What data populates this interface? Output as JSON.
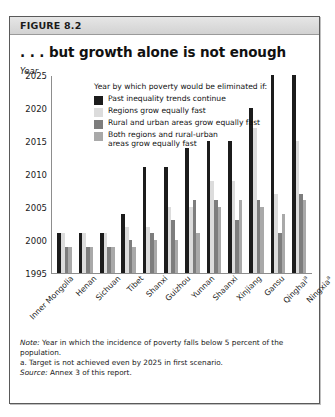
{
  "figure": {
    "number": "FIGURE 8.2",
    "title": ". . . but growth alone is not enough",
    "axis_unit_label": "Year"
  },
  "legend": {
    "title": "Year by which poverty would be eliminated if:",
    "items": [
      {
        "label": "Past inequality trends continue",
        "color": "#1c1c1c"
      },
      {
        "label": "Regions grow equally fast",
        "color": "#dcdcdc"
      },
      {
        "label": "Rural and urban areas grow equally fast",
        "color": "#7d7d7d"
      },
      {
        "label": "Both regions and rural-urban\nareas grow equally fast",
        "color": "#a9a9a9"
      }
    ]
  },
  "notes": {
    "note_label": "Note:",
    "note_text": " Year in which the incidence of poverty falls below 5 percent of the population.",
    "footnote_a": "a. Target is not achieved even by 2025 in first scenario.",
    "source_label": "Source:",
    "source_text": " Annex 3 of this report."
  },
  "chart_data": {
    "type": "bar",
    "title": ". . . but growth alone is not enough",
    "xlabel": "",
    "ylabel": "Year",
    "ylim": [
      1995,
      2025
    ],
    "yticks": [
      1995,
      2000,
      2005,
      2010,
      2015,
      2020,
      2025
    ],
    "grid": false,
    "legend_position": "inside-top-left",
    "categories": [
      "Inner Mongolia",
      "Henan",
      "Sichuan",
      "Tibet",
      "Shanxi",
      "Guizhou",
      "Yunnan",
      "Shaanxi",
      "Xinjiang",
      "Gansu",
      "Qinghaiᵃ",
      "Ningxiaᵃ"
    ],
    "series": [
      {
        "name": "Past inequality trends continue",
        "color": "#1c1c1c",
        "values": [
          2001,
          2001,
          2001,
          2004,
          2011,
          2011,
          2014,
          2015,
          2015,
          2020,
          2025,
          2025
        ]
      },
      {
        "name": "Regions grow equally fast",
        "color": "#dcdcdc",
        "values": [
          2001,
          2001,
          2001,
          2002,
          2002,
          2005,
          2005,
          2009,
          2009,
          2017,
          2007,
          2015
        ]
      },
      {
        "name": "Rural and urban areas grow equally fast",
        "color": "#7d7d7d",
        "values": [
          1999,
          1999,
          1999,
          2000,
          2001,
          2003,
          2006,
          2006,
          2003,
          2006,
          2001,
          2007
        ]
      },
      {
        "name": "Both regions and rural-urban areas grow equally fast",
        "color": "#a9a9a9",
        "values": [
          1999,
          1999,
          1999,
          1999,
          2000,
          2000,
          2001,
          2005,
          2006,
          2005,
          2004,
          2006
        ]
      }
    ]
  }
}
